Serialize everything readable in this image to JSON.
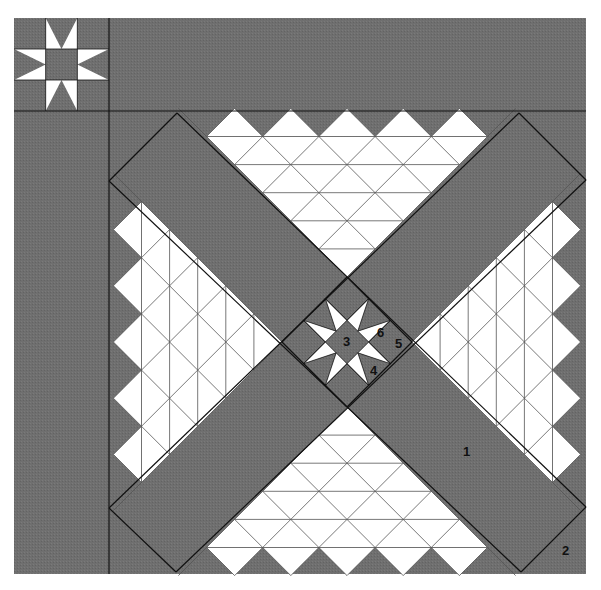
{
  "colors": {
    "fabric_dark": "#6e6e6e",
    "fabric_light": "#ffffff",
    "seam_line": "#111111",
    "grid_line": "#555555",
    "background": "#ffffff"
  },
  "corner_block": {
    "name": "eight-point star",
    "color_center": "dark",
    "color_points": "light"
  },
  "center_block": {
    "name": "eight-point star set on point"
  },
  "pyramids": {
    "count": 4,
    "rows_per_pyramid": 5,
    "sawtooth_tips": 5,
    "positions": [
      "top",
      "right",
      "bottom",
      "left"
    ]
  },
  "piece_labels": [
    {
      "id": "1",
      "text": "1",
      "piece": "sashing band"
    },
    {
      "id": "2",
      "text": "2",
      "piece": "corner setting triangle"
    },
    {
      "id": "3",
      "text": "3",
      "piece": "star center square"
    },
    {
      "id": "4",
      "text": "4",
      "piece": "star corner square"
    },
    {
      "id": "5",
      "text": "5",
      "piece": "star setting triangle"
    },
    {
      "id": "6",
      "text": "6",
      "piece": "star point triangle"
    }
  ]
}
